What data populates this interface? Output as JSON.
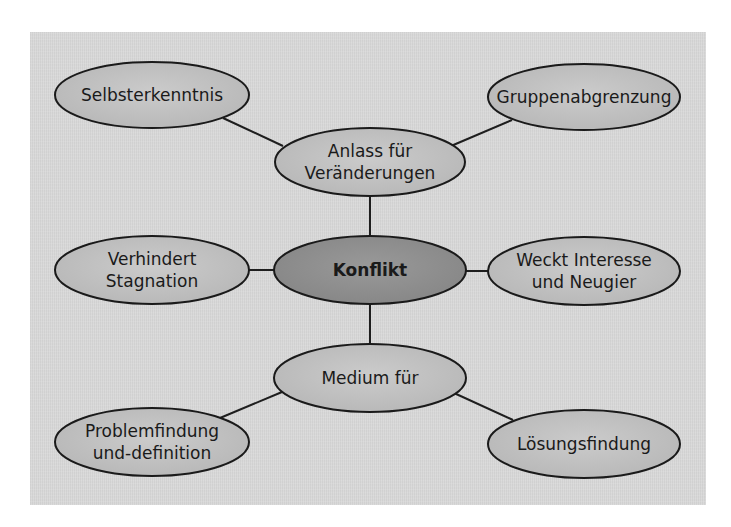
{
  "diagram": {
    "type": "mind-map",
    "background_color": "#d9d9d9",
    "center": {
      "id": "konflikt",
      "lines": [
        "Konflikt"
      ],
      "fill": "#8f8f8f",
      "cx": 370,
      "cy": 270,
      "rx": 96,
      "ry": 34
    },
    "nodes": [
      {
        "id": "anlass",
        "lines": [
          "Anlass für",
          "Veränderungen"
        ],
        "fill": "#c2c2c2",
        "cx": 370,
        "cy": 162,
        "rx": 95,
        "ry": 34
      },
      {
        "id": "selbsterkenntnis",
        "lines": [
          "Selbsterkenntnis"
        ],
        "fill": "#c2c2c2",
        "cx": 152,
        "cy": 95,
        "rx": 97,
        "ry": 33
      },
      {
        "id": "gruppenabgrenzung",
        "lines": [
          "Gruppenabgrenzung"
        ],
        "fill": "#c2c2c2",
        "cx": 584,
        "cy": 97,
        "rx": 96,
        "ry": 33
      },
      {
        "id": "verhindert",
        "lines": [
          "Verhindert",
          "Stagnation"
        ],
        "fill": "#c2c2c2",
        "cx": 152,
        "cy": 270,
        "rx": 97,
        "ry": 34
      },
      {
        "id": "weckt",
        "lines": [
          "Weckt Interesse",
          "und Neugier"
        ],
        "fill": "#c2c2c2",
        "cx": 584,
        "cy": 271,
        "rx": 96,
        "ry": 34
      },
      {
        "id": "medium",
        "lines": [
          "Medium für"
        ],
        "fill": "#c2c2c2",
        "cx": 370,
        "cy": 378,
        "rx": 96,
        "ry": 34
      },
      {
        "id": "problemfindung",
        "lines": [
          "Problemfindung",
          "und-definition"
        ],
        "fill": "#c2c2c2",
        "cx": 152,
        "cy": 442,
        "rx": 97,
        "ry": 34
      },
      {
        "id": "loesungsfindung",
        "lines": [
          "Lösungsfindung"
        ],
        "fill": "#c2c2c2",
        "cx": 584,
        "cy": 444,
        "rx": 96,
        "ry": 34
      }
    ],
    "edges": [
      {
        "from": "konflikt",
        "to": "anlass",
        "x1": 370,
        "y1": 236,
        "x2": 370,
        "y2": 196
      },
      {
        "from": "konflikt",
        "to": "medium",
        "x1": 370,
        "y1": 304,
        "x2": 370,
        "y2": 344
      },
      {
        "from": "konflikt",
        "to": "verhindert",
        "x1": 274,
        "y1": 270,
        "x2": 249,
        "y2": 270
      },
      {
        "from": "konflikt",
        "to": "weckt",
        "x1": 466,
        "y1": 271,
        "x2": 488,
        "y2": 271
      },
      {
        "from": "anlass",
        "to": "selbsterkenntnis",
        "x1": 283,
        "y1": 146,
        "x2": 223,
        "y2": 118
      },
      {
        "from": "anlass",
        "to": "gruppenabgrenzung",
        "x1": 451,
        "y1": 146,
        "x2": 512,
        "y2": 120
      },
      {
        "from": "medium",
        "to": "problemfindung",
        "x1": 282,
        "y1": 392,
        "x2": 220,
        "y2": 418
      },
      {
        "from": "medium",
        "to": "loesungsfindung",
        "x1": 454,
        "y1": 393,
        "x2": 513,
        "y2": 420
      }
    ]
  }
}
